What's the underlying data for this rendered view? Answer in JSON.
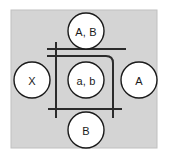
{
  "figure": {
    "name": "state-transition-diagram",
    "canvas": {
      "width": 169,
      "height": 160
    },
    "panel": {
      "name": "diagram-panel",
      "x": 11,
      "y": 10,
      "width": 146,
      "height": 138,
      "fill": "#d4d4d4",
      "stroke": "#c0c0c0"
    },
    "colors": {
      "background": "#ffffff",
      "panel_fill": "#d4d4d4",
      "node_fill": "#ffffff",
      "node_stroke": "#1a1a1a",
      "label_text": "#1a1a1a",
      "connector_stroke": "#2b2b2b"
    },
    "nodes": [
      {
        "name": "node-top",
        "label": "A, B",
        "cx": 86,
        "cy": 31,
        "r": 18
      },
      {
        "name": "node-left",
        "label": "X",
        "cx": 32,
        "cy": 80,
        "r": 18
      },
      {
        "name": "node-center",
        "label": "a, b",
        "cx": 86,
        "cy": 80,
        "r": 18
      },
      {
        "name": "node-right",
        "label": "A",
        "cx": 139,
        "cy": 80,
        "r": 18
      },
      {
        "name": "node-bottom",
        "label": "B",
        "cx": 86,
        "cy": 130,
        "r": 18
      }
    ],
    "connectors": [
      {
        "name": "connector-top-horizontal-outer",
        "shape": "line",
        "x1": 47,
        "y1": 49,
        "x2": 126,
        "y2": 49
      },
      {
        "name": "connector-top-horizontal-inner",
        "shape": "path",
        "d": "M 47 56 L 106 56 Q 113 56 113 63 L 113 118"
      },
      {
        "name": "connector-left-vertical",
        "shape": "line",
        "x1": 56,
        "y1": 42,
        "x2": 56,
        "y2": 118
      },
      {
        "name": "connector-bottom-horizontal",
        "shape": "line",
        "x1": 48,
        "y1": 109,
        "x2": 122,
        "y2": 109
      }
    ]
  }
}
